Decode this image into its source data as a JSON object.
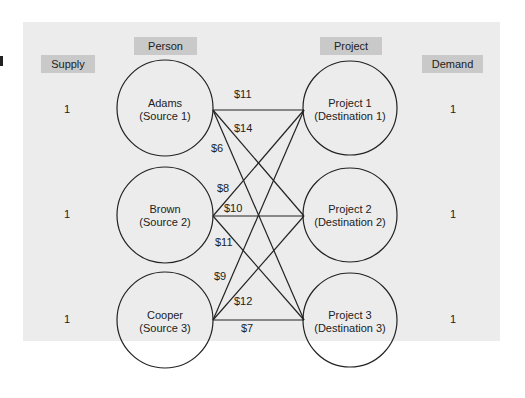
{
  "headers": {
    "supply": "Supply",
    "person": "Person",
    "project": "Project",
    "demand": "Demand"
  },
  "supply": [
    "1",
    "1",
    "1"
  ],
  "demand": [
    "1",
    "1",
    "1"
  ],
  "sources": [
    {
      "name": "Adams",
      "sub": "(Source 1)"
    },
    {
      "name": "Brown",
      "sub": "(Source 2)"
    },
    {
      "name": "Cooper",
      "sub": "(Source 3)"
    }
  ],
  "destinations": [
    {
      "name": "Project 1",
      "sub": "(Destination 1)"
    },
    {
      "name": "Project 2",
      "sub": "(Destination 2)"
    },
    {
      "name": "Project 3",
      "sub": "(Destination 3)"
    }
  ],
  "costs": {
    "a1": "$11",
    "a2": "$14",
    "a3": "$6",
    "b1": "$8",
    "b2": "$10",
    "b3": "$11",
    "c1": "$9",
    "c2": "$12",
    "c3": "$7"
  },
  "colors": {
    "panel": "#ececec",
    "header_fill": "#c9c9c9",
    "stroke": "#222222"
  }
}
